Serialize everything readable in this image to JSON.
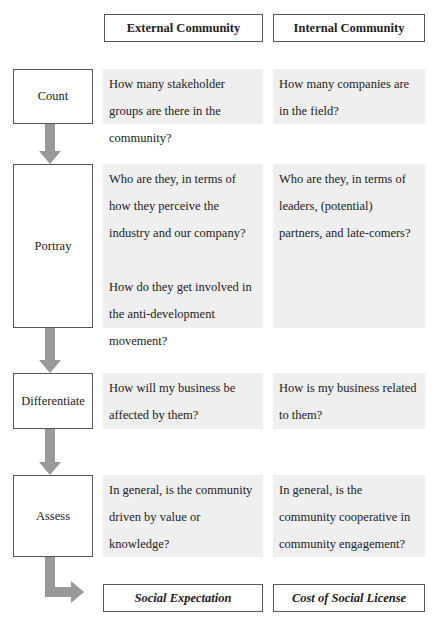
{
  "headers": {
    "external": "External Community",
    "internal": "Internal Community"
  },
  "steps": [
    {
      "label": "Count",
      "external": [
        "How many stakeholder groups are there in the community?"
      ],
      "internal": [
        "How many companies are in the field?"
      ]
    },
    {
      "label": "Portray",
      "external": [
        "Who are they, in terms of how they perceive the industry and our company?",
        "How do they get involved in the anti-development movement?"
      ],
      "internal": [
        "Who are they, in terms of leaders, (potential) partners, and late-comers?"
      ]
    },
    {
      "label": "Differentiate",
      "external": [
        "How will my business be affected by them?"
      ],
      "internal": [
        "How is my business related to them?"
      ]
    },
    {
      "label": "Assess",
      "external": [
        "In general, is the community driven by value or knowledge?"
      ],
      "internal": [
        "In general, is the community cooperative in community engagement?"
      ]
    }
  ],
  "outputs": {
    "external": "Social Expectation",
    "internal": "Cost of Social License"
  },
  "colors": {
    "arrow": "#999999",
    "cell_shade": "#efefef",
    "border": "#555555"
  }
}
